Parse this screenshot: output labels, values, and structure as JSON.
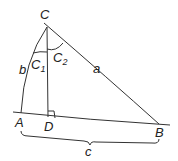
{
  "diagram": {
    "type": "spherical-triangle",
    "vertices": {
      "A": "A",
      "B": "B",
      "C": "C",
      "D": "D"
    },
    "sides": {
      "a": "a",
      "b": "b",
      "c": "c"
    },
    "angles": {
      "C1": {
        "base": "C",
        "sub": "1"
      },
      "C2": {
        "base": "C",
        "sub": "2"
      }
    },
    "right_angle_at": "D",
    "stroke_color": "#333333"
  }
}
